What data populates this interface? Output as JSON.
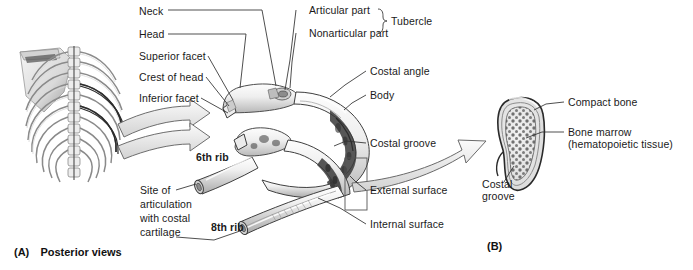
{
  "figure": {
    "title_hidden": "Rib anatomy: posterior views and cross-section",
    "background": "#ffffff",
    "line_color": "#3a3a3a",
    "text_color": "#1a1a1a"
  },
  "panels": [
    {
      "id": "A",
      "label": "(A)",
      "caption": "Posterior views",
      "x": 14,
      "y": 248
    },
    {
      "id": "B",
      "label": "(B)",
      "caption": "",
      "x": 487,
      "y": 243
    }
  ],
  "labels": [
    {
      "name": "neck",
      "text": "Neck",
      "x": 139,
      "y": 12,
      "align": "left"
    },
    {
      "name": "head",
      "text": "Head",
      "x": 139,
      "y": 36,
      "align": "left"
    },
    {
      "name": "superior-facet",
      "text": "Superior facet",
      "x": 139,
      "y": 58,
      "align": "left"
    },
    {
      "name": "crest-of-head",
      "text": "Crest of head",
      "x": 139,
      "y": 79,
      "align": "left"
    },
    {
      "name": "inferior-facet",
      "text": "Inferior facet",
      "x": 139,
      "y": 99,
      "align": "left"
    },
    {
      "name": "articular-part",
      "text": "Articular part",
      "x": 309,
      "y": 12,
      "align": "left"
    },
    {
      "name": "nonarticular-part",
      "text": "Nonarticular part",
      "x": 309,
      "y": 35,
      "align": "left"
    },
    {
      "name": "tubercle",
      "text": "Tubercle",
      "x": 390,
      "y": 24,
      "align": "left"
    },
    {
      "name": "costal-angle",
      "text": "Costal angle",
      "x": 370,
      "y": 73,
      "align": "left"
    },
    {
      "name": "body",
      "text": "Body",
      "x": 370,
      "y": 97,
      "align": "left"
    },
    {
      "name": "costal-groove-rib",
      "text": "Costal groove",
      "x": 370,
      "y": 145,
      "align": "left"
    },
    {
      "name": "external-surface",
      "text": "External surface",
      "x": 370,
      "y": 192,
      "align": "left"
    },
    {
      "name": "internal-surface",
      "text": "Internal surface",
      "x": 370,
      "y": 226,
      "align": "left"
    },
    {
      "name": "sixth-rib",
      "text": "6th rib",
      "x": 196,
      "y": 153,
      "align": "left",
      "bold": true
    },
    {
      "name": "eighth-rib",
      "text": "8th rib",
      "x": 211,
      "y": 223,
      "align": "left",
      "bold": true
    },
    {
      "name": "compact-bone",
      "text": "Compact bone",
      "x": 568,
      "y": 104,
      "align": "left"
    },
    {
      "name": "bone-marrow",
      "text": "Bone marrow\n(hematopoietic tissue)",
      "x": 568,
      "y": 134,
      "align": "left",
      "multiline": true
    },
    {
      "name": "costal-groove-xsec",
      "text": "Costal\ngroove",
      "x": 482,
      "y": 185,
      "align": "left",
      "multiline": true
    },
    {
      "name": "site-of-articulation",
      "text": "Site of\narticulation\nwith costal\ncartilage",
      "x": 140,
      "y": 189,
      "align": "left",
      "multiline": true
    }
  ],
  "artwork": {
    "ribcage": {
      "name": "posterior-ribcage-illustration",
      "x": 14,
      "y": 45,
      "width": 135,
      "height": 150
    },
    "sixth_rib": {
      "name": "sixth-rib-illustration"
    },
    "eighth_rib": {
      "name": "eighth-rib-illustration"
    },
    "cross_section": {
      "name": "rib-cross-section-illustration",
      "x": 495,
      "y": 96,
      "width": 60,
      "height": 100
    },
    "detail_box": {
      "name": "detail-highlight-box",
      "x": 345,
      "y": 160,
      "width": 22,
      "height": 50
    },
    "arrows": [
      {
        "name": "arrow-to-sixth-rib"
      },
      {
        "name": "arrow-to-eighth-rib"
      },
      {
        "name": "arrow-to-cross-section"
      }
    ]
  }
}
